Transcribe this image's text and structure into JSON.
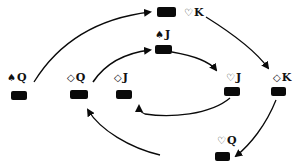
{
  "diagram": {
    "type": "card-cycle",
    "nodes": [
      {
        "id": "sQ",
        "suit": "♠",
        "rank": "Q",
        "label_x": 7,
        "label_y": 72,
        "card_x": 11,
        "card_y": 91
      },
      {
        "id": "dQ",
        "suit": "◇",
        "rank": "Q",
        "label_x": 67,
        "label_y": 72,
        "card_x": 70,
        "card_y": 90
      },
      {
        "id": "dJ",
        "suit": "◇",
        "rank": "J",
        "label_x": 114,
        "label_y": 72,
        "card_x": 116,
        "card_y": 90
      },
      {
        "id": "sJ",
        "suit": "♠",
        "rank": "J",
        "label_x": 155,
        "label_y": 29,
        "card_x": 155,
        "card_y": 45
      },
      {
        "id": "hK",
        "suit": "♡",
        "rank": "K",
        "label_x": 184,
        "label_y": 7,
        "card_x": 157,
        "card_y": 7
      },
      {
        "id": "hJ",
        "suit": "♡",
        "rank": "J",
        "label_x": 226,
        "label_y": 72,
        "card_x": 224,
        "card_y": 87
      },
      {
        "id": "dK",
        "suit": "◇",
        "rank": "K",
        "label_x": 273,
        "label_y": 72,
        "card_x": 271,
        "card_y": 87
      },
      {
        "id": "hQ",
        "suit": "♡",
        "rank": "Q",
        "label_x": 217,
        "label_y": 135,
        "card_x": 215,
        "card_y": 152
      }
    ],
    "edges": [
      {
        "from": "sQ",
        "to": "hK"
      },
      {
        "from": "hK",
        "to": "dK"
      },
      {
        "from": "dK",
        "to": "hQ"
      },
      {
        "from": "hQ",
        "to": "dQ"
      },
      {
        "from": "dQ",
        "to": "sJ"
      },
      {
        "from": "sJ",
        "to": "hJ"
      },
      {
        "from": "hJ",
        "to": "dJ"
      }
    ],
    "colors": {
      "ink": "#0a0a0a",
      "background": "#ffffff"
    }
  }
}
